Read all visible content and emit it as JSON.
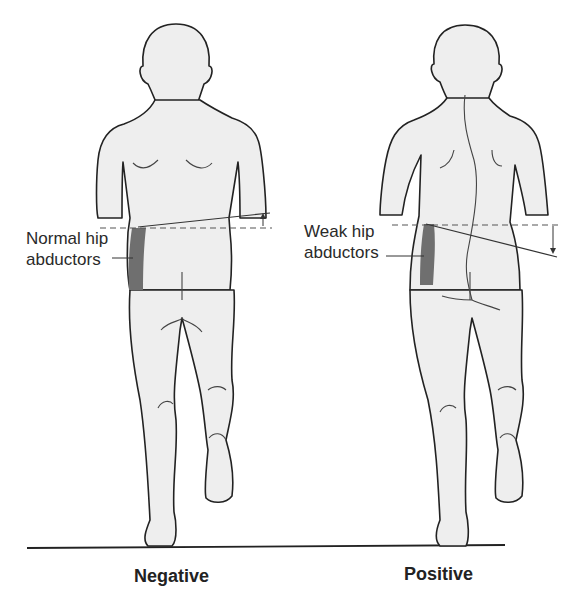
{
  "figure": {
    "panels": [
      {
        "id": "negative",
        "caption": "Negative",
        "label_line1": "Normal hip",
        "label_line2": "abductors",
        "pelvis_tilt": "up",
        "spine": "straight"
      },
      {
        "id": "positive",
        "caption": "Positive",
        "label_line1": "Weak hip",
        "label_line2": "abductors",
        "pelvis_tilt": "down",
        "spine": "curved"
      }
    ],
    "colors": {
      "body_fill": "#eeeeee",
      "outline": "#222222",
      "muscle": "#6f6f6f",
      "background": "#ffffff"
    }
  }
}
